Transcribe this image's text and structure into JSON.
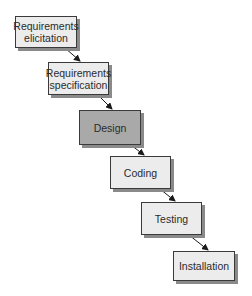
{
  "diagram": {
    "type": "waterfall-model",
    "stages": [
      {
        "label": "Requirements\nelicitation",
        "highlighted": false,
        "x": 15,
        "y": 16,
        "w": 62,
        "h": 32
      },
      {
        "label": "Requirements\nspecification",
        "highlighted": false,
        "x": 48,
        "y": 62,
        "w": 61,
        "h": 33
      },
      {
        "label": "Design",
        "highlighted": true,
        "x": 79,
        "y": 110,
        "w": 62,
        "h": 35
      },
      {
        "label": "Coding",
        "highlighted": false,
        "x": 110,
        "y": 156,
        "w": 61,
        "h": 33
      },
      {
        "label": "Testing",
        "highlighted": false,
        "x": 141,
        "y": 202,
        "w": 61,
        "h": 33
      },
      {
        "label": "Installation",
        "highlighted": false,
        "x": 173,
        "y": 251,
        "w": 62,
        "h": 30
      }
    ],
    "edges": [
      {
        "from": 0,
        "to": 1
      },
      {
        "from": 1,
        "to": 2
      },
      {
        "from": 2,
        "to": 3
      },
      {
        "from": 3,
        "to": 4
      },
      {
        "from": 4,
        "to": 5
      }
    ],
    "colors": {
      "box_fill": "#ececec",
      "box_highlight_fill": "#a9a9a9",
      "border": "#3a3a3a",
      "shadow": "#8a8a8a",
      "arrow": "#1a1a1a"
    }
  }
}
